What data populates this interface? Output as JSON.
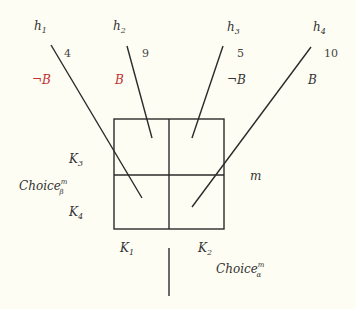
{
  "diagram": {
    "histories": [
      {
        "id": "h1",
        "name": "h",
        "sub": "1",
        "value": "4",
        "condition": "¬B",
        "condition_negated": true
      },
      {
        "id": "h2",
        "name": "h",
        "sub": "2",
        "value": "9",
        "condition": "B",
        "condition_negated": false
      },
      {
        "id": "h3",
        "name": "h",
        "sub": "3",
        "value": "5",
        "condition": "¬B",
        "condition_negated": true
      },
      {
        "id": "h4",
        "name": "h",
        "sub": "4",
        "value": "10",
        "condition": "B",
        "condition_negated": false
      }
    ],
    "cells": {
      "K1": {
        "name": "K",
        "sub": "1"
      },
      "K2": {
        "name": "K",
        "sub": "2"
      },
      "K3": {
        "name": "K",
        "sub": "3"
      },
      "K4": {
        "name": "K",
        "sub": "4"
      }
    },
    "moment_label": "m",
    "choice_beta": {
      "name": "Choice",
      "sup": "m",
      "sub": "β"
    },
    "choice_alpha": {
      "name": "Choice",
      "sup": "m",
      "sub": "α"
    }
  }
}
